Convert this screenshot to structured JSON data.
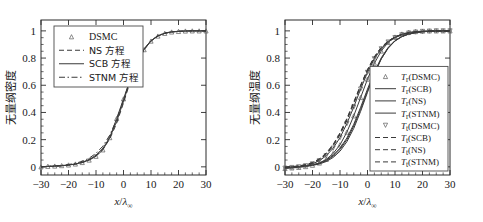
{
  "figure": {
    "background_color": "#ffffff",
    "foreground_color": "#1a1a1a"
  },
  "chart_data": [
    {
      "panel": "left",
      "type": "line",
      "title": "",
      "xlabel": "x/λ∞",
      "xlabel_parts": {
        "var": "x",
        "slash": "/",
        "lambda": "λ",
        "subscript": "∞"
      },
      "ylabel": "无量纲密度",
      "xlim": [
        -30,
        30
      ],
      "ylim": [
        -0.06,
        1.08
      ],
      "xticks": [
        -30,
        -20,
        -10,
        0,
        10,
        20,
        30
      ],
      "xtick_labels": [
        "−30",
        "−20",
        "−10",
        "0",
        "10",
        "20",
        "30"
      ],
      "yticks": [
        0,
        0.2,
        0.4,
        0.6,
        0.8,
        1
      ],
      "ytick_labels": [
        "0",
        "0.2",
        "0.4",
        "0.6",
        "0.8",
        "1"
      ],
      "grid": false,
      "legend_position": "upper left",
      "legend": [
        {
          "label": "DSMC",
          "style": "marker",
          "marker": "triangle-up",
          "has_line": false
        },
        {
          "label": "NS 方程",
          "style": "dashed",
          "marker": "none",
          "has_line": true
        },
        {
          "label": "SCB 方程",
          "style": "solid",
          "marker": "none",
          "has_line": true
        },
        {
          "label": "STNM 方程",
          "style": "dashdot",
          "marker": "none",
          "has_line": true
        }
      ],
      "x": [
        -30,
        -27.5,
        -25,
        -22.5,
        -20,
        -17.5,
        -15,
        -12.5,
        -10,
        -7.5,
        -5,
        -2.5,
        0,
        2.5,
        5,
        7.5,
        10,
        12.5,
        15,
        17.5,
        20,
        22.5,
        25,
        27.5,
        30
      ],
      "series": [
        {
          "name": "DSMC",
          "values": [
            0.0,
            0.004,
            0.006,
            0.009,
            0.014,
            0.021,
            0.032,
            0.05,
            0.078,
            0.125,
            0.215,
            0.355,
            0.5,
            0.645,
            0.77,
            0.862,
            0.925,
            0.962,
            0.982,
            0.992,
            0.996,
            0.999,
            1.0,
            1.0,
            1.0
          ]
        },
        {
          "name": "NS 方程",
          "values": [
            0.0,
            0.002,
            0.004,
            0.007,
            0.012,
            0.019,
            0.031,
            0.05,
            0.08,
            0.128,
            0.205,
            0.32,
            0.47,
            0.63,
            0.765,
            0.862,
            0.925,
            0.962,
            0.982,
            0.992,
            0.997,
            0.999,
            1.0,
            1.0,
            1.0
          ]
        },
        {
          "name": "SCB 方程",
          "values": [
            0.0,
            0.003,
            0.005,
            0.008,
            0.013,
            0.021,
            0.034,
            0.054,
            0.086,
            0.136,
            0.216,
            0.333,
            0.483,
            0.64,
            0.772,
            0.866,
            0.928,
            0.964,
            0.983,
            0.993,
            0.997,
            0.999,
            1.0,
            1.0,
            1.0
          ]
        },
        {
          "name": "STNM 方程",
          "values": [
            0.0,
            0.004,
            0.007,
            0.011,
            0.017,
            0.026,
            0.041,
            0.064,
            0.099,
            0.152,
            0.233,
            0.348,
            0.492,
            0.645,
            0.775,
            0.868,
            0.929,
            0.965,
            0.984,
            0.993,
            0.997,
            0.999,
            1.0,
            1.0,
            1.0
          ]
        }
      ]
    },
    {
      "panel": "right",
      "type": "line",
      "title": "",
      "xlabel": "x/λ∞",
      "xlabel_parts": {
        "var": "x",
        "slash": "/",
        "lambda": "λ",
        "subscript": "∞"
      },
      "ylabel": "无量纲温度",
      "xlim": [
        -30,
        30
      ],
      "ylim": [
        -0.06,
        1.08
      ],
      "xticks": [
        -30,
        -20,
        -10,
        0,
        10,
        20,
        30
      ],
      "xtick_labels": [
        "−30",
        "−20",
        "−10",
        "0",
        "10",
        "20",
        "30"
      ],
      "yticks": [
        0,
        0.2,
        0.4,
        0.6,
        0.8,
        1
      ],
      "ytick_labels": [
        "0",
        "0.2",
        "0.4",
        "0.6",
        "0.8",
        "1"
      ],
      "grid": false,
      "legend_position": "lower right",
      "legend": [
        {
          "label": "Tr(DSMC)",
          "base": "T",
          "sub": "r",
          "rest": "(DSMC)",
          "style": "marker",
          "marker": "triangle-up",
          "has_line": false
        },
        {
          "label": "Tr(SCB)",
          "base": "T",
          "sub": "r",
          "rest": "(SCB)",
          "style": "solid",
          "marker": "none",
          "has_line": true
        },
        {
          "label": "Tr(NS)",
          "base": "T",
          "sub": "r",
          "rest": "(NS)",
          "style": "solid",
          "marker": "none",
          "has_line": true
        },
        {
          "label": "Tr(STNM)",
          "base": "T",
          "sub": "r",
          "rest": "(STNM)",
          "style": "solid",
          "marker": "none",
          "has_line": true
        },
        {
          "label": "Tt(DSMC)",
          "base": "T",
          "sub": "t",
          "rest": "(DSMC)",
          "style": "marker",
          "marker": "triangle-down",
          "has_line": false
        },
        {
          "label": "Tt(SCB)",
          "base": "T",
          "sub": "t",
          "rest": "(SCB)",
          "style": "dashed",
          "marker": "none",
          "has_line": true
        },
        {
          "label": "Tt(NS)",
          "base": "T",
          "sub": "t",
          "rest": "(NS)",
          "style": "dashed",
          "marker": "none",
          "has_line": true
        },
        {
          "label": "Tt(STNM)",
          "base": "T",
          "sub": "t",
          "rest": "(STNM)",
          "style": "dashed",
          "marker": "none",
          "has_line": true
        }
      ],
      "x": [
        -30,
        -27.5,
        -25,
        -22.5,
        -20,
        -17.5,
        -15,
        -12.5,
        -10,
        -7.5,
        -5,
        -2.5,
        0,
        2.5,
        5,
        7.5,
        10,
        12.5,
        15,
        17.5,
        20,
        22.5,
        25,
        27.5,
        30
      ],
      "series": [
        {
          "name": "Tr(DSMC)",
          "values": [
            -0.012,
            -0.008,
            -0.004,
            0.002,
            0.012,
            0.028,
            0.055,
            0.098,
            0.162,
            0.255,
            0.375,
            0.51,
            0.645,
            0.762,
            0.852,
            0.915,
            0.955,
            0.977,
            0.989,
            0.995,
            0.998,
            1.0,
            1.0,
            1.0,
            1.0
          ]
        },
        {
          "name": "Tr(SCB)",
          "values": [
            -0.005,
            -0.002,
            0.002,
            0.006,
            0.013,
            0.025,
            0.045,
            0.078,
            0.128,
            0.2,
            0.3,
            0.423,
            0.558,
            0.688,
            0.795,
            0.873,
            0.925,
            0.957,
            0.976,
            0.987,
            0.993,
            0.997,
            0.999,
            1.0,
            1.0
          ]
        },
        {
          "name": "Tr(NS)",
          "values": [
            -0.004,
            -0.002,
            0.001,
            0.005,
            0.011,
            0.021,
            0.039,
            0.069,
            0.115,
            0.185,
            0.283,
            0.408,
            0.548,
            0.683,
            0.793,
            0.873,
            0.927,
            0.959,
            0.978,
            0.988,
            0.994,
            0.997,
            0.999,
            1.0,
            1.0
          ]
        },
        {
          "name": "Tr(STNM)",
          "values": [
            -0.006,
            -0.003,
            0.001,
            0.007,
            0.015,
            0.028,
            0.05,
            0.085,
            0.138,
            0.212,
            0.313,
            0.438,
            0.572,
            0.698,
            0.802,
            0.878,
            0.929,
            0.959,
            0.977,
            0.988,
            0.994,
            0.997,
            0.999,
            1.0,
            1.0
          ]
        },
        {
          "name": "Tt(DSMC)",
          "values": [
            -0.01,
            -0.005,
            0.0,
            0.008,
            0.022,
            0.045,
            0.082,
            0.137,
            0.215,
            0.318,
            0.44,
            0.572,
            0.695,
            0.795,
            0.868,
            0.918,
            0.95,
            0.971,
            0.984,
            0.991,
            0.996,
            0.998,
            1.0,
            1.0,
            1.0
          ]
        },
        {
          "name": "Tt(SCB)",
          "values": [
            -0.004,
            0.0,
            0.005,
            0.013,
            0.027,
            0.052,
            0.092,
            0.152,
            0.235,
            0.34,
            0.463,
            0.59,
            0.708,
            0.805,
            0.876,
            0.924,
            0.954,
            0.973,
            0.985,
            0.992,
            0.996,
            0.998,
            0.999,
            1.0,
            1.0
          ]
        },
        {
          "name": "Tt(NS)",
          "values": [
            -0.003,
            0.001,
            0.007,
            0.016,
            0.032,
            0.059,
            0.102,
            0.165,
            0.25,
            0.356,
            0.477,
            0.602,
            0.716,
            0.81,
            0.879,
            0.926,
            0.955,
            0.974,
            0.985,
            0.992,
            0.996,
            0.998,
            0.999,
            1.0,
            1.0
          ]
        },
        {
          "name": "Tt(STNM)",
          "values": [
            -0.005,
            0.0,
            0.006,
            0.015,
            0.03,
            0.056,
            0.098,
            0.16,
            0.245,
            0.35,
            0.472,
            0.598,
            0.713,
            0.808,
            0.878,
            0.925,
            0.955,
            0.974,
            0.985,
            0.992,
            0.996,
            0.998,
            0.999,
            1.0,
            1.0
          ]
        }
      ]
    }
  ]
}
